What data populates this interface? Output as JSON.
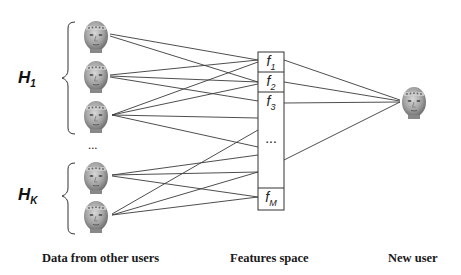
{
  "groups": [
    {
      "label": "H",
      "subscript": "1"
    },
    {
      "label": "H",
      "subscript": "K"
    }
  ],
  "ellipsis_users": "...",
  "features": [
    {
      "label": "f",
      "subscript": "1"
    },
    {
      "label": "f",
      "subscript": "2"
    },
    {
      "label": "f",
      "subscript": "3"
    },
    {
      "label": "...",
      "subscript": ""
    },
    {
      "label": "f",
      "subscript": "M"
    }
  ],
  "captions": {
    "left": "Data from other users",
    "middle": "Features space",
    "right": "New user"
  },
  "colors": {
    "line": "#3a3a3a",
    "face": "#9a9a9a",
    "box": "#333333"
  }
}
